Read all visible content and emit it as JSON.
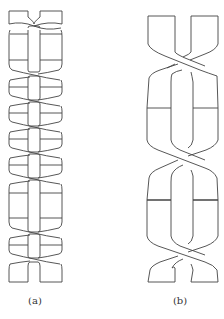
{
  "figure": {
    "panels": [
      {
        "id": "a",
        "caption": "(a)",
        "description": "Tightly braided band with many small crossings and horizontal cuts"
      },
      {
        "id": "b",
        "caption": "(b)",
        "description": "Two twisted bands crossing three times with two horizontal cuts"
      }
    ],
    "colors": {
      "stroke": "#444444",
      "background": "#ffffff"
    }
  }
}
